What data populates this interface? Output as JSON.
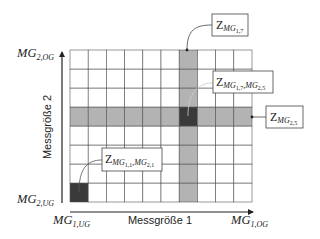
{
  "diagram": {
    "grid": {
      "columns": 10,
      "rows": 8,
      "highlighted_column": 7,
      "highlighted_row": 5,
      "marked_cells": [
        {
          "col": 1,
          "row": 1
        },
        {
          "col": 7,
          "row": 5
        }
      ],
      "colors": {
        "cell_fill": "#ffffff",
        "grid_line": "#555555",
        "highlight_fill": "#b3b3b3",
        "marked_fill": "#3a3a3a"
      }
    },
    "axes": {
      "x": {
        "title": "Messgröße 1",
        "min_label": {
          "base": "MG",
          "sub": "1,UG"
        },
        "max_label": {
          "base": "MG",
          "sub": "1,OG"
        }
      },
      "y": {
        "title": "Messgröße 2",
        "min_label": {
          "base": "MG",
          "sub": "2,UG"
        },
        "max_label": {
          "base": "MG",
          "sub": "2,OG"
        }
      }
    },
    "callouts": [
      {
        "id": "column-callout",
        "base": "Z",
        "sub": "MG",
        "subsub": "1,7",
        "tail": ""
      },
      {
        "id": "intersection-callout",
        "base": "Z",
        "sub": "MG",
        "subsub": "1,7",
        "sub2": ",MG",
        "subsub2": "2,5"
      },
      {
        "id": "row-callout",
        "base": "Z",
        "sub": "MG",
        "subsub": "2,5"
      },
      {
        "id": "origin-cell-callout",
        "base": "Z",
        "sub": "MG",
        "subsub": "1,1",
        "sub2": ",MG",
        "subsub2": "2,1"
      }
    ]
  }
}
